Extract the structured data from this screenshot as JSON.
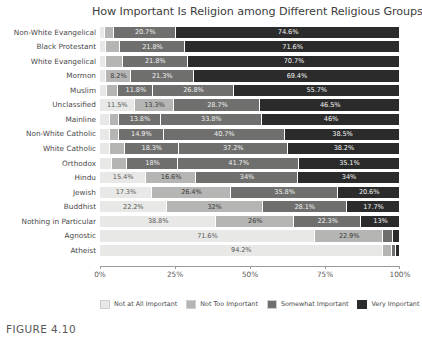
{
  "figure": {
    "caption": "FIGURE 4.10"
  },
  "chart_data": {
    "type": "bar",
    "orientation": "horizontal",
    "stacked": true,
    "normalized": true,
    "title": "How Important Is Religion among Different Religious Groups",
    "xlabel": "",
    "ylabel": "",
    "xlim": [
      0,
      100
    ],
    "xticks": [
      0,
      25,
      50,
      75,
      100
    ],
    "xticklabels": [
      "0%",
      "25%",
      "50%",
      "75%",
      "100%"
    ],
    "grid": false,
    "legend_position": "bottom",
    "legend": [
      "Not at All Important",
      "Not Too Important",
      "Somewhat Important",
      "Very Important"
    ],
    "colors": [
      "#e8e8e6",
      "#b5b5b3",
      "#6f6f6e",
      "#2b2b2b"
    ],
    "categories": [
      "Non-White Evangelical",
      "Black Protestant",
      "White Evangelical",
      "Mormon",
      "Muslim",
      "Unclassified",
      "Mainline",
      "Non-White Catholic",
      "White Catholic",
      "Orthodox",
      "Hindu",
      "Jewish",
      "Buddhist",
      "Nothing in Particular",
      "Agnostic",
      "Atheist"
    ],
    "series": [
      {
        "name": "Not at All Important",
        "values": [
          1.5,
          1.9,
          2.0,
          2.1,
          2.4,
          11.5,
          3.2,
          3.5,
          3.5,
          4.0,
          15.4,
          17.3,
          22.2,
          38.8,
          71.6,
          94.2
        ]
      },
      {
        "name": "Not Too Important",
        "values": [
          3.2,
          4.7,
          5.5,
          8.2,
          3.7,
          13.3,
          3.2,
          2.9,
          5.0,
          5.2,
          16.6,
          26.4,
          32.0,
          26.0,
          22.9,
          3.1
        ]
      },
      {
        "name": "Somewhat Important",
        "values": [
          20.7,
          21.8,
          21.8,
          21.3,
          11.8,
          28.7,
          13.8,
          14.9,
          18.3,
          18.0,
          34.0,
          35.8,
          28.1,
          22.3,
          3.2,
          1.3
        ]
      },
      {
        "name": "Very Important",
        "values": [
          74.6,
          71.6,
          70.7,
          69.4,
          55.7,
          46.5,
          46.0,
          38.5,
          38.2,
          35.1,
          34.0,
          20.6,
          17.7,
          13.0,
          2.3,
          1.4
        ]
      }
    ],
    "rows": [
      {
        "category": "Non-White Evangelical",
        "segments": [
          {
            "series": "Not at All Important",
            "value": 1.5,
            "label": ""
          },
          {
            "series": "Not Too Important",
            "value": 3.2,
            "label": ""
          },
          {
            "series": "Somewhat Important",
            "value": 20.7,
            "label": "20.7%"
          },
          {
            "series": "Very Important",
            "value": 74.6,
            "label": "74.6%"
          }
        ]
      },
      {
        "category": "Black Protestant",
        "segments": [
          {
            "series": "Not at All Important",
            "value": 1.9,
            "label": ""
          },
          {
            "series": "Not Too Important",
            "value": 4.7,
            "label": ""
          },
          {
            "series": "Somewhat Important",
            "value": 21.8,
            "label": "21.8%"
          },
          {
            "series": "Very Important",
            "value": 71.6,
            "label": "71.6%"
          }
        ]
      },
      {
        "category": "White Evangelical",
        "segments": [
          {
            "series": "Not at All Important",
            "value": 2.0,
            "label": ""
          },
          {
            "series": "Not Too Important",
            "value": 5.5,
            "label": ""
          },
          {
            "series": "Somewhat Important",
            "value": 21.8,
            "label": "21.8%"
          },
          {
            "series": "Very Important",
            "value": 70.7,
            "label": "70.7%"
          }
        ]
      },
      {
        "category": "Mormon",
        "segments": [
          {
            "series": "Not at All Important",
            "value": 2.1,
            "label": ""
          },
          {
            "series": "Not Too Important",
            "value": 8.2,
            "label": "8.2%"
          },
          {
            "series": "Somewhat Important",
            "value": 21.3,
            "label": "21.3%"
          },
          {
            "series": "Very Important",
            "value": 69.4,
            "label": "69.4%"
          }
        ]
      },
      {
        "category": "Muslim",
        "segments": [
          {
            "series": "Not at All Important",
            "value": 2.4,
            "label": ""
          },
          {
            "series": "Not Too Important",
            "value": 3.7,
            "label": ""
          },
          {
            "series": "Somewhat Important",
            "value": 11.8,
            "label": "11.8%"
          },
          {
            "series": "Very Important",
            "value": 26.8,
            "label": "26.8%"
          },
          {
            "series": "Very Important",
            "value": 55.7,
            "label": "55.7%"
          }
        ]
      },
      {
        "category": "Unclassified",
        "segments": [
          {
            "series": "Not at All Important",
            "value": 11.5,
            "label": "11.5%"
          },
          {
            "series": "Not Too Important",
            "value": 13.3,
            "label": "13.3%"
          },
          {
            "series": "Somewhat Important",
            "value": 28.7,
            "label": "28.7%"
          },
          {
            "series": "Very Important",
            "value": 46.5,
            "label": "46.5%"
          }
        ]
      },
      {
        "category": "Mainline",
        "segments": [
          {
            "series": "Not at All Important",
            "value": 3.2,
            "label": ""
          },
          {
            "series": "Not Too Important",
            "value": 3.2,
            "label": ""
          },
          {
            "series": "Somewhat Important",
            "value": 13.8,
            "label": "13.8%"
          },
          {
            "series": "Very Important",
            "value": 33.8,
            "label": "33.8%"
          },
          {
            "series": "Very Important",
            "value": 46.0,
            "label": "46%"
          }
        ]
      },
      {
        "category": "Non-White Catholic",
        "segments": [
          {
            "series": "Not at All Important",
            "value": 3.5,
            "label": ""
          },
          {
            "series": "Not Too Important",
            "value": 2.9,
            "label": ""
          },
          {
            "series": "Somewhat Important",
            "value": 14.9,
            "label": "14.9%"
          },
          {
            "series": "Very Important",
            "value": 40.7,
            "label": "40.7%"
          },
          {
            "series": "Very Important",
            "value": 38.5,
            "label": "38.5%"
          }
        ]
      },
      {
        "category": "White Catholic",
        "segments": [
          {
            "series": "Not at All Important",
            "value": 3.5,
            "label": ""
          },
          {
            "series": "Not Too Important",
            "value": 5.0,
            "label": ""
          },
          {
            "series": "Somewhat Important",
            "value": 18.3,
            "label": "18.3%"
          },
          {
            "series": "Very Important",
            "value": 37.2,
            "label": "37.2%"
          },
          {
            "series": "Very Important",
            "value": 38.2,
            "label": "38.2%"
          }
        ]
      },
      {
        "category": "Orthodox",
        "segments": [
          {
            "series": "Not at All Important",
            "value": 4.0,
            "label": ""
          },
          {
            "series": "Not Too Important",
            "value": 5.2,
            "label": ""
          },
          {
            "series": "Somewhat Important",
            "value": 18.0,
            "label": "18%"
          },
          {
            "series": "Very Important",
            "value": 41.7,
            "label": "41.7%"
          },
          {
            "series": "Very Important",
            "value": 35.1,
            "label": "35.1%"
          }
        ]
      },
      {
        "category": "Hindu",
        "segments": [
          {
            "series": "Not at All Important",
            "value": 15.4,
            "label": "15.4%"
          },
          {
            "series": "Not Too Important",
            "value": 16.6,
            "label": "16.6%"
          },
          {
            "series": "Somewhat Important",
            "value": 34.0,
            "label": "34%"
          },
          {
            "series": "Very Important",
            "value": 34.0,
            "label": "34%"
          }
        ]
      },
      {
        "category": "Jewish",
        "segments": [
          {
            "series": "Not at All Important",
            "value": 17.3,
            "label": "17.3%"
          },
          {
            "series": "Not Too Important",
            "value": 26.4,
            "label": "26.4%"
          },
          {
            "series": "Somewhat Important",
            "value": 35.8,
            "label": "35.8%"
          },
          {
            "series": "Very Important",
            "value": 20.6,
            "label": "20.6%"
          }
        ]
      },
      {
        "category": "Buddhist",
        "segments": [
          {
            "series": "Not at All Important",
            "value": 22.2,
            "label": "22.2%"
          },
          {
            "series": "Not Too Important",
            "value": 32.0,
            "label": "32%"
          },
          {
            "series": "Somewhat Important",
            "value": 28.1,
            "label": "28.1%"
          },
          {
            "series": "Very Important",
            "value": 17.7,
            "label": "17.7%"
          }
        ]
      },
      {
        "category": "Nothing in Particular",
        "segments": [
          {
            "series": "Not at All Important",
            "value": 38.8,
            "label": "38.8%"
          },
          {
            "series": "Not Too Important",
            "value": 26.0,
            "label": "26%"
          },
          {
            "series": "Somewhat Important",
            "value": 22.3,
            "label": "22.3%"
          },
          {
            "series": "Very Important",
            "value": 13.0,
            "label": "13%"
          }
        ]
      },
      {
        "category": "Agnostic",
        "segments": [
          {
            "series": "Not at All Important",
            "value": 71.6,
            "label": "71.6%"
          },
          {
            "series": "Not Too Important",
            "value": 22.9,
            "label": "22.9%"
          },
          {
            "series": "Somewhat Important",
            "value": 3.2,
            "label": ""
          },
          {
            "series": "Very Important",
            "value": 2.3,
            "label": ""
          }
        ]
      },
      {
        "category": "Atheist",
        "segments": [
          {
            "series": "Not at All Important",
            "value": 94.2,
            "label": "94.2%"
          },
          {
            "series": "Not Too Important",
            "value": 3.1,
            "label": ""
          },
          {
            "series": "Somewhat Important",
            "value": 1.3,
            "label": ""
          },
          {
            "series": "Very Important",
            "value": 1.4,
            "label": ""
          }
        ]
      }
    ]
  }
}
